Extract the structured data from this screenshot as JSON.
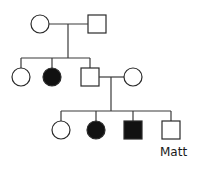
{
  "diagram": {
    "type": "pedigree",
    "colors": {
      "affected": "#111111",
      "unaffected": "#ffffff",
      "stroke": "#2a2a2a"
    },
    "generations": [
      {
        "id": "I",
        "individuals": [
          {
            "id": "I-1",
            "sex": "female",
            "affected": false
          },
          {
            "id": "I-2",
            "sex": "male",
            "affected": false
          }
        ]
      },
      {
        "id": "II",
        "individuals": [
          {
            "id": "II-1",
            "sex": "female",
            "affected": false
          },
          {
            "id": "II-2",
            "sex": "female",
            "affected": true
          },
          {
            "id": "II-3",
            "sex": "male",
            "affected": false
          },
          {
            "id": "II-4",
            "sex": "female",
            "affected": false,
            "note": "spouse of II-3"
          }
        ]
      },
      {
        "id": "III",
        "individuals": [
          {
            "id": "III-1",
            "sex": "female",
            "affected": false
          },
          {
            "id": "III-2",
            "sex": "female",
            "affected": true
          },
          {
            "id": "III-3",
            "sex": "male",
            "affected": true
          },
          {
            "id": "III-4",
            "sex": "male",
            "affected": false,
            "label": "Matt"
          }
        ]
      }
    ],
    "labels": {
      "matt": "Matt"
    }
  }
}
